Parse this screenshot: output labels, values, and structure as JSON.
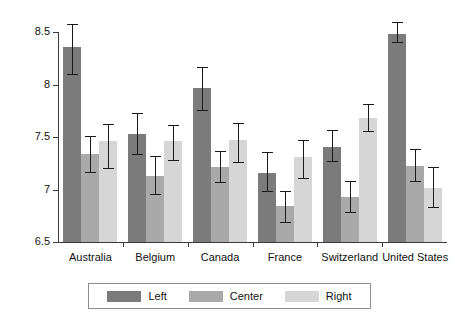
{
  "chart_data": {
    "type": "bar",
    "title": "",
    "xlabel": "",
    "ylabel": "",
    "categories": [
      "Australia",
      "Belgium",
      "Canada",
      "France",
      "Switzerland",
      "United States"
    ],
    "series": [
      {
        "name": "Left",
        "color": "#7b7b7b",
        "values": [
          8.36,
          7.53,
          7.97,
          7.16,
          7.41,
          8.49
        ],
        "err_low": [
          8.1,
          7.34,
          7.76,
          6.99,
          7.27,
          8.41
        ],
        "err_high": [
          8.58,
          7.73,
          8.17,
          7.36,
          7.57,
          8.6
        ]
      },
      {
        "name": "Center",
        "color": "#a9a9a9",
        "values": [
          7.34,
          7.13,
          7.22,
          6.84,
          6.93,
          7.23
        ],
        "err_low": [
          7.17,
          6.96,
          7.07,
          6.69,
          6.79,
          7.08
        ],
        "err_high": [
          7.51,
          7.32,
          7.37,
          6.99,
          7.08,
          7.39
        ]
      },
      {
        "name": "Right",
        "color": "#d6d6d6",
        "values": [
          7.46,
          7.46,
          7.47,
          7.31,
          7.68,
          7.02
        ],
        "err_low": [
          7.21,
          7.28,
          7.26,
          7.11,
          7.56,
          6.83
        ],
        "err_high": [
          7.63,
          7.62,
          7.64,
          7.47,
          7.82,
          7.22
        ]
      }
    ],
    "ylim": [
      6.5,
      8.6
    ],
    "yticks": [
      6.5,
      7,
      7.5,
      8,
      8.5
    ],
    "ytick_labels": [
      "6.5",
      "7",
      "7.5",
      "8",
      "8.5"
    ],
    "grid": false,
    "legend": {
      "position": "bottom-center",
      "entries": [
        "Left",
        "Center",
        "Right"
      ]
    }
  }
}
